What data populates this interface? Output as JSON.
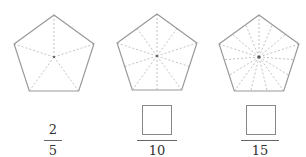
{
  "diagram": {
    "colors": {
      "outline": "#999999",
      "spoke": "#bbbbbb",
      "center": "#555555",
      "text": "#333333"
    },
    "pentagons": [
      {
        "cx": 54,
        "cy": 57,
        "r": 42,
        "parts": 5
      },
      {
        "cx": 157,
        "cy": 56,
        "r": 42,
        "parts": 10
      },
      {
        "cx": 259,
        "cy": 57,
        "r": 42,
        "parts": 15
      }
    ],
    "fractions": [
      {
        "numerator": "2",
        "numerator_blank": false,
        "denominator": "5",
        "cx": 53
      },
      {
        "numerator": "",
        "numerator_blank": true,
        "denominator": "10",
        "cx": 157
      },
      {
        "numerator": "",
        "numerator_blank": true,
        "denominator": "15",
        "cx": 260
      }
    ]
  }
}
